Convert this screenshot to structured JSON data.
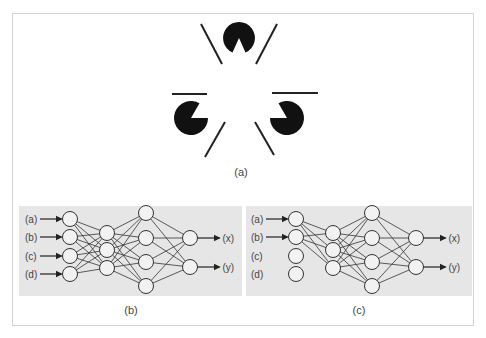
{
  "figure": {
    "panel_a": {
      "caption": "(a)",
      "description": "Kanizsa illusory triangle: three pac-man shapes and line fragments"
    },
    "panel_b": {
      "caption": "(b)",
      "inputs": [
        "(a)",
        "(b)",
        "(c)",
        "(d)"
      ],
      "connected_inputs": 4,
      "layers": [
        4,
        3,
        4,
        2
      ],
      "outputs": [
        "(x)",
        "(y)"
      ]
    },
    "panel_c": {
      "caption": "(c)",
      "inputs": [
        "(a)",
        "(b)",
        "(c)",
        "(d)"
      ],
      "connected_inputs": 2,
      "layers": [
        4,
        3,
        4,
        2
      ],
      "outputs": [
        "(x)",
        "(y)"
      ]
    }
  },
  "colors": {
    "panel_bg": "#e6e6e6",
    "ink": "#111111",
    "line": "#333333",
    "label": "#444444"
  }
}
